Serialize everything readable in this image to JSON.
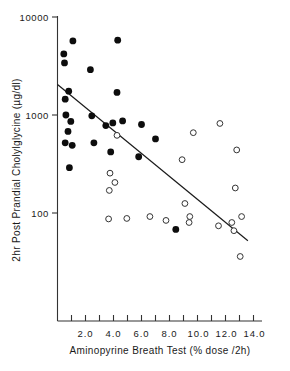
{
  "figure": {
    "background": "#ffffff",
    "ink": "#111111"
  },
  "chart_data": {
    "type": "scatter",
    "title": "",
    "xlabel": "Aminopyrine Breath Test (% dose /2h)",
    "ylabel": "2hr Post Prandial Cholylglycine (µg/dl)",
    "xscale": "linear",
    "yscale": "log",
    "xlim": [
      0,
      14.6
    ],
    "ylim": [
      30,
      10000
    ],
    "grid": false,
    "legend_position": "none",
    "xticks": [
      2.0,
      4.0,
      6.0,
      8.0,
      10.0,
      12.0,
      14.0
    ],
    "xtick_labels": [
      "2.0",
      "4.0",
      "6.0",
      "8.0",
      "10.0",
      "12.0",
      "14.0"
    ],
    "xminor_ticks": [
      1.0,
      3.0,
      5.0,
      7.0,
      9.0,
      11.0,
      13.0
    ],
    "yticks": [
      100,
      1000,
      10000
    ],
    "ytick_labels": [
      "100",
      "1000",
      "10000"
    ],
    "series": [
      {
        "name": "filled-circles",
        "marker": "filled-circle",
        "color": "#0d0d0d",
        "points": [
          {
            "x": 0.45,
            "y": 4200
          },
          {
            "x": 0.5,
            "y": 3400
          },
          {
            "x": 1.1,
            "y": 5700
          },
          {
            "x": 2.35,
            "y": 2900
          },
          {
            "x": 4.3,
            "y": 5800
          },
          {
            "x": 0.55,
            "y": 1450
          },
          {
            "x": 0.8,
            "y": 1750
          },
          {
            "x": 4.25,
            "y": 1700
          },
          {
            "x": 0.6,
            "y": 1000
          },
          {
            "x": 0.95,
            "y": 860
          },
          {
            "x": 0.75,
            "y": 680
          },
          {
            "x": 0.55,
            "y": 520
          },
          {
            "x": 1.05,
            "y": 490
          },
          {
            "x": 2.45,
            "y": 980
          },
          {
            "x": 3.45,
            "y": 780
          },
          {
            "x": 2.6,
            "y": 520
          },
          {
            "x": 3.95,
            "y": 830
          },
          {
            "x": 4.65,
            "y": 870
          },
          {
            "x": 6.0,
            "y": 800
          },
          {
            "x": 7.0,
            "y": 570
          },
          {
            "x": 3.8,
            "y": 420
          },
          {
            "x": 5.8,
            "y": 375
          },
          {
            "x": 0.85,
            "y": 290
          },
          {
            "x": 8.45,
            "y": 68
          }
        ]
      },
      {
        "name": "open-circles",
        "marker": "open-circle",
        "color": "#ffffff",
        "points": [
          {
            "x": 4.25,
            "y": 620
          },
          {
            "x": 9.7,
            "y": 660
          },
          {
            "x": 11.6,
            "y": 820
          },
          {
            "x": 8.9,
            "y": 350
          },
          {
            "x": 12.8,
            "y": 440
          },
          {
            "x": 3.75,
            "y": 255
          },
          {
            "x": 4.1,
            "y": 205
          },
          {
            "x": 3.7,
            "y": 170
          },
          {
            "x": 12.7,
            "y": 180
          },
          {
            "x": 9.1,
            "y": 125
          },
          {
            "x": 3.65,
            "y": 87
          },
          {
            "x": 4.95,
            "y": 88
          },
          {
            "x": 6.6,
            "y": 92
          },
          {
            "x": 7.75,
            "y": 84
          },
          {
            "x": 9.45,
            "y": 92
          },
          {
            "x": 9.4,
            "y": 80
          },
          {
            "x": 11.5,
            "y": 74
          },
          {
            "x": 12.45,
            "y": 80
          },
          {
            "x": 13.15,
            "y": 92
          },
          {
            "x": 12.6,
            "y": 66
          },
          {
            "x": 13.05,
            "y": 36
          }
        ]
      }
    ],
    "fit_line": {
      "name": "regression-line",
      "x_start": 0.0,
      "y_start": 2050,
      "x_end": 13.6,
      "y_end": 52
    }
  }
}
